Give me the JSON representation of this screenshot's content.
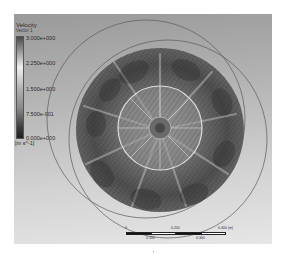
{
  "legend": {
    "title": "Velocity",
    "subtitle": "Vector 1",
    "ticks": [
      "3.000e+000",
      "2.250e+000",
      "1.500e+000",
      "7.500e-001",
      "0.000e+000"
    ],
    "units": "[m s^-1]"
  },
  "scale_bar": {
    "top_labels": [
      "0",
      "0.200",
      "0.400 (m)"
    ],
    "bottom_labels": [
      "0.100",
      "0.300"
    ]
  },
  "colors": {
    "background_top": "#9a9a9a",
    "background_bottom": "#e6e6e6",
    "vectors": "#3a3a3a",
    "boundary": "#5a5a5a"
  }
}
